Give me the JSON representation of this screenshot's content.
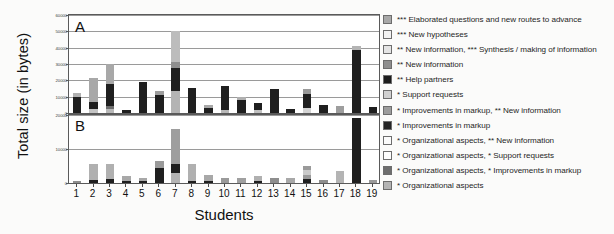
{
  "axis": {
    "y_title": "Total size (in bytes)",
    "x_title": "Students"
  },
  "panels": {
    "a": {
      "letter": "A"
    },
    "b": {
      "letter": "B"
    }
  },
  "legend": {
    "items": [
      {
        "label": "*** Elaborated questions and new routes to advance",
        "color": "#a8a8a8"
      },
      {
        "label": "*** New hypotheses",
        "color": "#f2f2f2"
      },
      {
        "label": "** New information, *** Synthesis / making of information",
        "color": "#e4e4e4"
      },
      {
        "label": "** New information",
        "color": "#8e8e8e"
      },
      {
        "label": "** Help partners",
        "color": "#1c1c1c"
      },
      {
        "label": "* Support requests",
        "color": "#d0d0d0"
      },
      {
        "label": "* Improvements in  markup, ** New information",
        "color": "#9c9c9c"
      },
      {
        "label": "* Improvements in  markup",
        "color": "#242424"
      },
      {
        "label": "* Organizational aspects, ** New information",
        "color": "#fbfbfb"
      },
      {
        "label": "* Organizational aspects, * Support requests",
        "color": "#fdfdfd"
      },
      {
        "label": "* Organizational aspects, * Improvements in  markup",
        "color": "#6e6e6e"
      },
      {
        "label": "* Organizational aspects",
        "color": "#b4b4b4"
      }
    ]
  },
  "chart_data": {
    "type": "bar",
    "title": "",
    "xlabel": "Students",
    "ylabel": "Total size (in bytes)",
    "stacked": true,
    "legend_position": "right",
    "grid": true,
    "categories": [
      "1",
      "2",
      "3",
      "4",
      "5",
      "6",
      "7",
      "8",
      "9",
      "10",
      "11",
      "12",
      "13",
      "14",
      "15",
      "16",
      "17",
      "18",
      "19"
    ],
    "series_names": [
      "* Organizational aspects",
      "* Organizational aspects, * Improvements in  markup",
      "* Organizational aspects, * Support requests",
      "* Organizational aspects, ** New information",
      "* Improvements in  markup",
      "* Improvements in  markup, ** New information",
      "* Support requests",
      "** Help partners",
      "** New information",
      "** New information, *** Synthesis / making of information",
      "*** New hypotheses",
      "*** Elaborated questions and new routes to advance"
    ],
    "panels": [
      {
        "id": "A",
        "label": "A",
        "ylim": [
          0,
          60000
        ],
        "yticks": [
          0,
          10000,
          20000,
          30000,
          40000,
          50000,
          60000
        ],
        "ytick_labels": [
          "0",
          "10000",
          "20000",
          "30000",
          "40000",
          "50000",
          "60000"
        ],
        "totals": [
          12000,
          21500,
          30000,
          2000,
          19000,
          13500,
          50000,
          15500,
          5000,
          16500,
          10000,
          6000,
          14500,
          2500,
          14500,
          5000,
          4000,
          41000,
          3500
        ],
        "bars": [
          {
            "student": "1",
            "total": 12000,
            "segments": [
              {
                "series": "* Improvements in  markup",
                "value": 9500,
                "color": "#1f1f1f"
              },
              {
                "series": "* Organizational aspects",
                "value": 2500,
                "color": "#b0b0b0"
              }
            ]
          },
          {
            "student": "2",
            "total": 21500,
            "segments": [
              {
                "series": "* Organizational aspects",
                "value": 2500,
                "color": "#c4c4c4"
              },
              {
                "series": "* Improvements in  markup",
                "value": 4000,
                "color": "#1f1f1f"
              },
              {
                "series": "*** Elaborated questions and new routes to advance",
                "value": 15000,
                "color": "#a8a8a8"
              }
            ]
          },
          {
            "student": "3",
            "total": 30000,
            "segments": [
              {
                "series": "* Organizational aspects",
                "value": 2500,
                "color": "#b8b8b8"
              },
              {
                "series": "* Organizational aspects, * Improvements in  markup",
                "value": 2000,
                "color": "#6e6e6e"
              },
              {
                "series": "* Improvements in  markup",
                "value": 13000,
                "color": "#1f1f1f"
              },
              {
                "series": "*** Elaborated questions and new routes to advance",
                "value": 12500,
                "color": "#a8a8a8"
              }
            ]
          },
          {
            "student": "4",
            "total": 2000,
            "segments": [
              {
                "series": "* Improvements in  markup",
                "value": 2000,
                "color": "#1f1f1f"
              }
            ]
          },
          {
            "student": "5",
            "total": 19000,
            "segments": [
              {
                "series": "* Improvements in  markup",
                "value": 19000,
                "color": "#1f1f1f"
              }
            ]
          },
          {
            "student": "6",
            "total": 13500,
            "segments": [
              {
                "series": "* Improvements in  markup",
                "value": 11000,
                "color": "#1f1f1f"
              },
              {
                "series": "* Organizational aspects",
                "value": 2500,
                "color": "#9e9e9e"
              }
            ]
          },
          {
            "student": "7",
            "total": 50000,
            "segments": [
              {
                "series": "* Organizational aspects",
                "value": 13500,
                "color": "#b4b4b4"
              },
              {
                "series": "* Improvements in  markup",
                "value": 14000,
                "color": "#1f1f1f"
              },
              {
                "series": "** New information",
                "value": 3500,
                "color": "#8e8e8e"
              },
              {
                "series": "*** Elaborated questions and new routes to advance",
                "value": 19000,
                "color": "#bcbcbc"
              }
            ]
          },
          {
            "student": "8",
            "total": 15500,
            "segments": [
              {
                "series": "* Improvements in  markup",
                "value": 15500,
                "color": "#1f1f1f"
              }
            ]
          },
          {
            "student": "9",
            "total": 5000,
            "segments": [
              {
                "series": "* Improvements in  markup",
                "value": 3000,
                "color": "#1f1f1f"
              },
              {
                "series": "* Organizational aspects",
                "value": 2000,
                "color": "#a8a8a8"
              }
            ]
          },
          {
            "student": "10",
            "total": 16500,
            "segments": [
              {
                "series": "* Organizational aspects",
                "value": 2000,
                "color": "#b8b8b8"
              },
              {
                "series": "* Improvements in  markup",
                "value": 14500,
                "color": "#1f1f1f"
              }
            ]
          },
          {
            "student": "11",
            "total": 10000,
            "segments": [
              {
                "series": "* Improvements in  markup",
                "value": 8000,
                "color": "#1f1f1f"
              },
              {
                "series": "* Organizational aspects",
                "value": 2000,
                "color": "#b0b0b0"
              }
            ]
          },
          {
            "student": "12",
            "total": 6000,
            "segments": [
              {
                "series": "* Organizational aspects",
                "value": 2000,
                "color": "#c0c0c0"
              },
              {
                "series": "* Improvements in  markup",
                "value": 4000,
                "color": "#1f1f1f"
              }
            ]
          },
          {
            "student": "13",
            "total": 14500,
            "segments": [
              {
                "series": "* Improvements in  markup",
                "value": 14500,
                "color": "#1f1f1f"
              }
            ]
          },
          {
            "student": "14",
            "total": 2500,
            "segments": [
              {
                "series": "* Improvements in  markup",
                "value": 2500,
                "color": "#1f1f1f"
              }
            ]
          },
          {
            "student": "15",
            "total": 14500,
            "segments": [
              {
                "series": "* Organizational aspects",
                "value": 3000,
                "color": "#d4d4d4"
              },
              {
                "series": "* Improvements in  markup",
                "value": 8500,
                "color": "#1f1f1f"
              },
              {
                "series": "* Organizational aspects",
                "value": 3000,
                "color": "#9a9a9a"
              }
            ]
          },
          {
            "student": "16",
            "total": 5000,
            "segments": [
              {
                "series": "* Improvements in  markup",
                "value": 5000,
                "color": "#1f1f1f"
              }
            ]
          },
          {
            "student": "17",
            "total": 4000,
            "segments": [
              {
                "series": "* Organizational aspects",
                "value": 4000,
                "color": "#9e9e9e"
              }
            ]
          },
          {
            "student": "18",
            "total": 41000,
            "segments": [
              {
                "series": "* Improvements in  markup",
                "value": 38500,
                "color": "#1f1f1f"
              },
              {
                "series": "* Organizational aspects",
                "value": 2500,
                "color": "#b4b4b4"
              }
            ]
          },
          {
            "student": "19",
            "total": 3500,
            "segments": [
              {
                "series": "* Improvements in  markup",
                "value": 3500,
                "color": "#1f1f1f"
              }
            ]
          }
        ]
      },
      {
        "id": "B",
        "label": "B",
        "ylim": [
          0,
          20000
        ],
        "yticks": [
          0,
          10000,
          20000
        ],
        "ytick_labels": [
          "0",
          "10000",
          "20000"
        ],
        "totals": [
          500,
          5500,
          5500,
          2000,
          1500,
          6500,
          16000,
          5500,
          2500,
          1500,
          1500,
          2000,
          1500,
          5000,
          1000,
          3500,
          1000,
          19000,
          1000
        ],
        "bars": [
          {
            "student": "1",
            "total": 500,
            "segments": [
              {
                "series": "* Organizational aspects",
                "value": 500,
                "color": "#8e8e8e"
              }
            ]
          },
          {
            "student": "2",
            "total": 5500,
            "segments": [
              {
                "series": "* Improvements in  markup",
                "value": 800,
                "color": "#1f1f1f"
              },
              {
                "series": "* Organizational aspects",
                "value": 4700,
                "color": "#b0b0b0"
              }
            ]
          },
          {
            "student": "3",
            "total": 5500,
            "segments": [
              {
                "series": "* Improvements in  markup",
                "value": 1200,
                "color": "#1f1f1f"
              },
              {
                "series": "* Organizational aspects",
                "value": 4300,
                "color": "#b0b0b0"
              }
            ]
          },
          {
            "student": "4",
            "total": 2000,
            "segments": [
              {
                "series": "* Improvements in  markup",
                "value": 700,
                "color": "#1f1f1f"
              },
              {
                "series": "* Organizational aspects",
                "value": 1300,
                "color": "#a8a8a8"
              }
            ]
          },
          {
            "student": "5",
            "total": 1500,
            "segments": [
              {
                "series": "* Improvements in  markup",
                "value": 700,
                "color": "#1f1f1f"
              },
              {
                "series": "* Organizational aspects",
                "value": 800,
                "color": "#a8a8a8"
              }
            ]
          },
          {
            "student": "6",
            "total": 6500,
            "segments": [
              {
                "series": "* Improvements in  markup",
                "value": 4500,
                "color": "#1f1f1f"
              },
              {
                "series": "* Organizational aspects",
                "value": 2000,
                "color": "#9a9a9a"
              }
            ]
          },
          {
            "student": "7",
            "total": 16000,
            "segments": [
              {
                "series": "* Organizational aspects",
                "value": 3000,
                "color": "#b4b4b4"
              },
              {
                "series": "* Improvements in  markup",
                "value": 2500,
                "color": "#1f1f1f"
              },
              {
                "series": "*** Elaborated questions and new routes to advance",
                "value": 10500,
                "color": "#9e9e9e"
              }
            ]
          },
          {
            "student": "8",
            "total": 5500,
            "segments": [
              {
                "series": "* Improvements in  markup",
                "value": 700,
                "color": "#1f1f1f"
              },
              {
                "series": "* Organizational aspects",
                "value": 4800,
                "color": "#b0b0b0"
              }
            ]
          },
          {
            "student": "9",
            "total": 2500,
            "segments": [
              {
                "series": "* Improvements in  markup",
                "value": 600,
                "color": "#1f1f1f"
              },
              {
                "series": "* Organizational aspects",
                "value": 1900,
                "color": "#a8a8a8"
              }
            ]
          },
          {
            "student": "10",
            "total": 1500,
            "segments": [
              {
                "series": "* Organizational aspects",
                "value": 1500,
                "color": "#9a9a9a"
              }
            ]
          },
          {
            "student": "11",
            "total": 1500,
            "segments": [
              {
                "series": "* Organizational aspects",
                "value": 1500,
                "color": "#a0a0a0"
              }
            ]
          },
          {
            "student": "12",
            "total": 2000,
            "segments": [
              {
                "series": "* Improvements in  markup",
                "value": 600,
                "color": "#1f1f1f"
              },
              {
                "series": "* Organizational aspects",
                "value": 1400,
                "color": "#b0b0b0"
              }
            ]
          },
          {
            "student": "13",
            "total": 1500,
            "segments": [
              {
                "series": "* Organizational aspects",
                "value": 1500,
                "color": "#8e8e8e"
              }
            ]
          },
          {
            "student": "14",
            "total": 1500,
            "segments": [
              {
                "series": "* Organizational aspects",
                "value": 1500,
                "color": "#a8a8a8"
              }
            ]
          },
          {
            "student": "15",
            "total": 5000,
            "segments": [
              {
                "series": "* Improvements in  markup",
                "value": 1200,
                "color": "#1f1f1f"
              },
              {
                "series": "* Organizational aspects",
                "value": 1300,
                "color": "#9a9a9a"
              },
              {
                "series": "* Support requests",
                "value": 1300,
                "color": "#cacaca"
              },
              {
                "series": "* Organizational aspects",
                "value": 1200,
                "color": "#9a9a9a"
              }
            ]
          },
          {
            "student": "16",
            "total": 1000,
            "segments": [
              {
                "series": "* Organizational aspects",
                "value": 1000,
                "color": "#8e8e8e"
              }
            ]
          },
          {
            "student": "17",
            "total": 3500,
            "segments": [
              {
                "series": "* Organizational aspects",
                "value": 3500,
                "color": "#b4b4b4"
              }
            ]
          },
          {
            "student": "18",
            "total": 19000,
            "segments": [
              {
                "series": "* Improvements in  markup",
                "value": 19000,
                "color": "#1f1f1f"
              }
            ]
          },
          {
            "student": "19",
            "total": 1000,
            "segments": [
              {
                "series": "* Organizational aspects",
                "value": 1000,
                "color": "#9a9a9a"
              }
            ]
          }
        ]
      }
    ]
  }
}
